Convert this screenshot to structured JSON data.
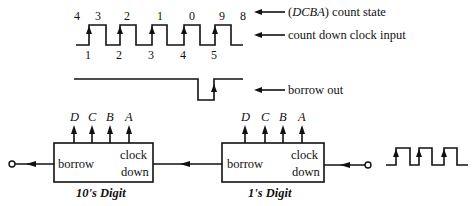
{
  "timing": {
    "count_states": [
      "4",
      "3",
      "2",
      "1",
      "0",
      "9",
      "8"
    ],
    "clock_pulse_numbers": [
      "1",
      "2",
      "3",
      "4",
      "5"
    ],
    "labels": {
      "count_state_prefix": "(",
      "count_state_vars": "DCBA",
      "count_state_suffix": ") count state",
      "clock": "count down clock input",
      "borrow": "borrow out"
    }
  },
  "counters": [
    {
      "caption": "10's Digit",
      "outputs": [
        "D",
        "C",
        "B",
        "A"
      ],
      "borrow_label": "borrow",
      "clock_label_1": "clock",
      "clock_label_2": "down"
    },
    {
      "caption": "1's Digit",
      "outputs": [
        "D",
        "C",
        "B",
        "A"
      ],
      "borrow_label": "borrow",
      "clock_label_1": "clock",
      "clock_label_2": "down"
    }
  ]
}
